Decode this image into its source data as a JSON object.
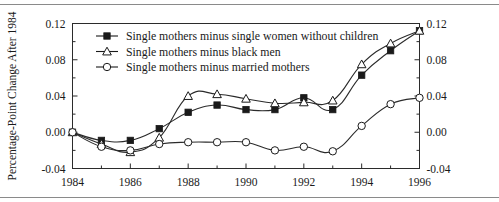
{
  "chart_data": {
    "type": "line",
    "title": "",
    "xlabel": "",
    "ylabel": "Percentage-Point Change After 1984",
    "x": [
      1984,
      1985,
      1986,
      1987,
      1988,
      1989,
      1990,
      1991,
      1992,
      1993,
      1994,
      1995,
      1996
    ],
    "xlim": [
      1984,
      1996
    ],
    "ylim": [
      -0.04,
      0.12
    ],
    "grid": false,
    "legend_position": "top-center",
    "x_major_ticks": [
      1984,
      1986,
      1988,
      1990,
      1992,
      1994,
      1996
    ],
    "x_major_tick_labels": [
      "1984",
      "1986",
      "1988",
      "1990",
      "1992",
      "1994",
      "1996"
    ],
    "x_minor_ticks": [
      1985,
      1987,
      1989,
      1991,
      1993,
      1995
    ],
    "y_ticks": [
      -0.04,
      0.0,
      0.04,
      0.08,
      0.12
    ],
    "y_tick_labels": [
      "-0.04",
      "0.00",
      "0.04",
      "0.08",
      "0.12"
    ],
    "y_tick_labels_right": [
      "-0.04",
      "0.00",
      "0.04",
      "0.08",
      "0.12"
    ],
    "y_minor_ticks": [
      -0.02,
      0.02,
      0.06,
      0.1
    ],
    "series": [
      {
        "name": "Single mothers minus single women without children",
        "marker": "filled-square",
        "color": "#1a1a1a",
        "values": [
          0.0,
          -0.009,
          -0.009,
          0.004,
          0.022,
          0.03,
          0.025,
          0.025,
          0.038,
          0.025,
          0.063,
          0.09,
          0.112
        ]
      },
      {
        "name": "Single mothers minus black men",
        "marker": "open-triangle",
        "color": "#1a1a1a",
        "values": [
          0.0,
          -0.013,
          -0.022,
          -0.006,
          0.04,
          0.042,
          0.037,
          0.032,
          0.033,
          0.035,
          0.075,
          0.098,
          0.112
        ]
      },
      {
        "name": "Single mothers minus married mothers",
        "marker": "open-circle",
        "color": "#1a1a1a",
        "values": [
          0.0,
          -0.016,
          -0.02,
          -0.013,
          -0.011,
          -0.011,
          -0.011,
          -0.02,
          -0.016,
          -0.021,
          0.007,
          0.031,
          0.038
        ]
      }
    ]
  },
  "legend": {
    "items": [
      {
        "label": "Single mothers minus single women without children",
        "marker": "filled-square"
      },
      {
        "label": "Single mothers minus black men",
        "marker": "open-triangle"
      },
      {
        "label": "Single mothers minus married mothers",
        "marker": "open-circle"
      }
    ]
  }
}
